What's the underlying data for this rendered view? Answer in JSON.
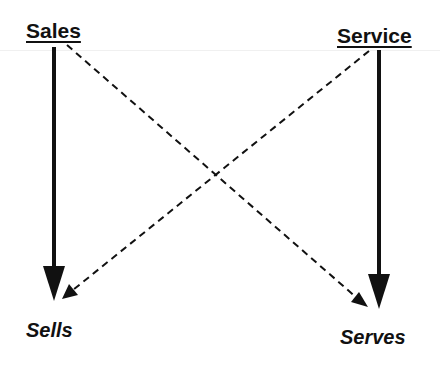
{
  "diagram": {
    "sources": [
      {
        "id": "sales",
        "label": "Sales"
      },
      {
        "id": "service",
        "label": "Service"
      }
    ],
    "targets": [
      {
        "id": "sells",
        "label": "Sells"
      },
      {
        "id": "serves",
        "label": "Serves"
      }
    ],
    "edges": [
      {
        "from": "Sales",
        "to": "Sells",
        "style": "solid"
      },
      {
        "from": "Service",
        "to": "Serves",
        "style": "solid"
      },
      {
        "from": "Sales",
        "to": "Serves",
        "style": "dashed"
      },
      {
        "from": "Service",
        "to": "Sells",
        "style": "dashed"
      }
    ],
    "colors": {
      "ink": "#111111",
      "background": "#ffffff"
    }
  }
}
